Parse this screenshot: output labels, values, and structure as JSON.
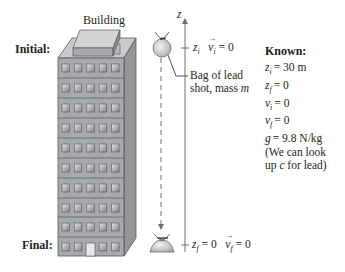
{
  "diagram": {
    "building_label": "Building",
    "initial_label": "Initial:",
    "final_label": "Final:",
    "axis_label": "z",
    "initial_annotation": {
      "z": "z",
      "z_sub": "i",
      "v": "v",
      "v_sub": "i",
      "value": "= 0"
    },
    "final_annotation": {
      "z": "z",
      "z_sub": "f",
      "z_value": "= 0",
      "v": "v",
      "v_sub": "f",
      "v_value": "= 0"
    },
    "bag_label_line1": "Bag of lead",
    "bag_label_line2": "shot, mass ",
    "bag_label_mass": "m",
    "building_floors": 10,
    "windows_per_floor": 5
  },
  "known": {
    "title": "Known:",
    "items": [
      {
        "sym": "z",
        "sub": "i",
        "value": "= 30 m"
      },
      {
        "sym": "z",
        "sub": "f",
        "value": "= 0"
      },
      {
        "sym": "v",
        "sub": "i",
        "value": "= 0"
      },
      {
        "sym": "v",
        "sub": "f",
        "value": "= 0"
      },
      {
        "sym": "g",
        "sub": "",
        "value": "= 9.8 N/kg"
      }
    ],
    "note_line1": "(We can look",
    "note_line2_pre": "up ",
    "note_line2_sym": "c",
    "note_line2_post": " for lead)"
  },
  "colors": {
    "building_front": "#a7a9ac",
    "building_side": "#8a8c8e",
    "building_top": "#c9cacc",
    "window": "#d1d3d4",
    "text": "#231f20",
    "axis": "#6d6e71"
  }
}
